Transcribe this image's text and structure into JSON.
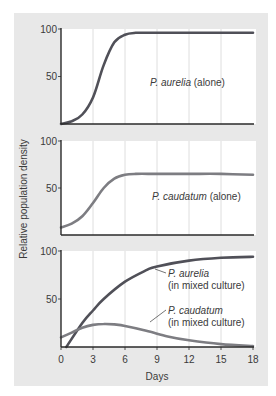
{
  "chart_data": [
    {
      "type": "line",
      "panel": 1,
      "title": "",
      "xlabel": "Days",
      "ylabel": "Relative population density",
      "xlim": [
        0,
        18
      ],
      "ylim": [
        0,
        100
      ],
      "xticks": [
        0,
        3,
        6,
        9,
        12,
        15,
        18
      ],
      "yticks": [
        50,
        100
      ],
      "grid": "vertical",
      "series": [
        {
          "name": "P. aurelia (alone)",
          "species": "P. aurelia",
          "condition": "(alone)",
          "color": "#505058",
          "x": [
            0,
            1,
            2,
            3,
            4,
            5,
            6,
            7,
            8,
            9,
            12,
            15,
            18
          ],
          "values": [
            0,
            3,
            10,
            28,
            62,
            86,
            94,
            96,
            96,
            96,
            96,
            96,
            96
          ]
        }
      ]
    },
    {
      "type": "line",
      "panel": 2,
      "xlim": [
        0,
        18
      ],
      "ylim": [
        0,
        100
      ],
      "xticks": [
        0,
        3,
        6,
        9,
        12,
        15,
        18
      ],
      "yticks": [
        50,
        100
      ],
      "grid": "vertical",
      "series": [
        {
          "name": "P. caudatum (alone)",
          "species": "P. caudatum",
          "condition": "(alone)",
          "color": "#7d7d82",
          "x": [
            0,
            1,
            2,
            3,
            4,
            5,
            6,
            7,
            9,
            12,
            15,
            18
          ],
          "values": [
            8,
            12,
            20,
            34,
            50,
            60,
            64,
            65,
            65,
            65,
            65,
            64
          ]
        }
      ]
    },
    {
      "type": "line",
      "panel": 3,
      "xlim": [
        0,
        18
      ],
      "ylim": [
        0,
        100
      ],
      "xticks": [
        0,
        3,
        6,
        9,
        12,
        15,
        18
      ],
      "yticks": [
        50,
        100
      ],
      "grid": "vertical",
      "series": [
        {
          "name": "P. aurelia (in mixed culture)",
          "species": "P. aurelia",
          "condition": "(in mixed culture)",
          "color": "#505058",
          "x": [
            0.5,
            2,
            3,
            4,
            6,
            8,
            9,
            12,
            15,
            18
          ],
          "values": [
            0,
            25,
            38,
            50,
            68,
            80,
            84,
            90,
            93,
            94
          ]
        },
        {
          "name": "P. caudatum (in mixed culture)",
          "species": "P. caudatum",
          "condition": "(in mixed culture)",
          "color": "#7d7d82",
          "x": [
            0,
            1,
            2,
            3,
            4,
            5,
            6,
            8,
            10,
            12,
            15,
            18
          ],
          "values": [
            10,
            15,
            20,
            23,
            24,
            23.5,
            22,
            17,
            11,
            7,
            3,
            1
          ]
        }
      ]
    }
  ],
  "figure": {
    "ylabel": "Relative population density",
    "xlabel": "Days",
    "xtick_labels": [
      "0",
      "3",
      "6",
      "9",
      "12",
      "15",
      "18"
    ],
    "ytick_labels": [
      "100",
      "50"
    ],
    "annotations": {
      "p1": {
        "species": "P. aurelia",
        "condition": " (alone)"
      },
      "p2": {
        "species": "P. caudatum",
        "condition": " (alone)"
      },
      "p3a": {
        "species": "P. aurelia",
        "condition": "(in mixed culture)"
      },
      "p3b": {
        "species": "P. caudatum",
        "condition": "(in mixed culture)"
      }
    },
    "colors": {
      "background": "#e8e8e8",
      "plot_area": "#ffffff",
      "grid": "#d6d6d6",
      "axis": "#2a2a2a",
      "aurelia": "#505058",
      "caudatum": "#7d7d82"
    }
  }
}
